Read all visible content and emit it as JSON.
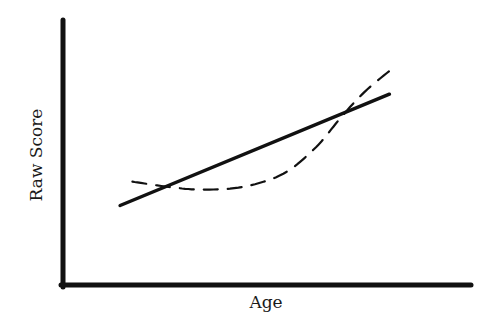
{
  "chart_data": {
    "type": "line",
    "title": "",
    "xlabel": "Age",
    "ylabel": "Raw Score",
    "grid": false,
    "legend": null,
    "x_ticks": [],
    "y_ticks": [],
    "xlim": [
      0,
      100
    ],
    "ylim": [
      0,
      100
    ],
    "series": [
      {
        "name": "linear-trend",
        "style": "solid",
        "x": [
          14,
          80
        ],
        "y": [
          30,
          72
        ]
      },
      {
        "name": "curvilinear-trend",
        "style": "dashed",
        "x": [
          17,
          26,
          34,
          44,
          54,
          62,
          68,
          74,
          81
        ],
        "y": [
          39,
          37,
          36,
          37,
          42,
          52,
          63,
          73,
          82
        ]
      }
    ],
    "colors": {
      "axis": "#111111",
      "line": "#111111",
      "background": "#ffffff"
    }
  }
}
